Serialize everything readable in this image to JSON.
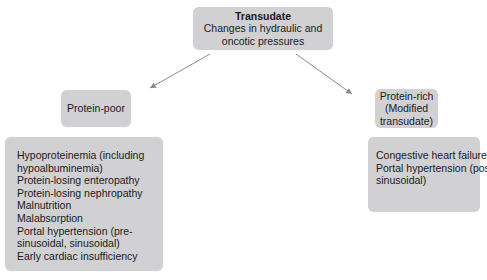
{
  "diagram": {
    "root": {
      "title": "Transudate",
      "subtitle_line1": "Changes in hydraulic and",
      "subtitle_line2": "oncotic pressures"
    },
    "left_branch": {
      "label": "Protein-poor",
      "items": [
        "Hypoproteinemia (including",
        "hypoalbuminemia)",
        "Protein-losing enteropathy",
        "Protein-losing nephropathy",
        "Malnutrition",
        "Malabsorption",
        "Portal hypertension (pre-",
        "sinusoidal, sinusoidal)",
        "Early cardiac insufficiency"
      ]
    },
    "right_branch": {
      "label_line1": "Protein-rich",
      "label_line2": "(Modified",
      "label_line3": "transudate)",
      "items": [
        "Congestive heart failure",
        "Portal hypertension (post-",
        "sinusoidal)"
      ]
    },
    "colors": {
      "box_fill": "#d1d1d3",
      "arrow": "#8a8a8a",
      "text": "#1a1a1a"
    }
  }
}
